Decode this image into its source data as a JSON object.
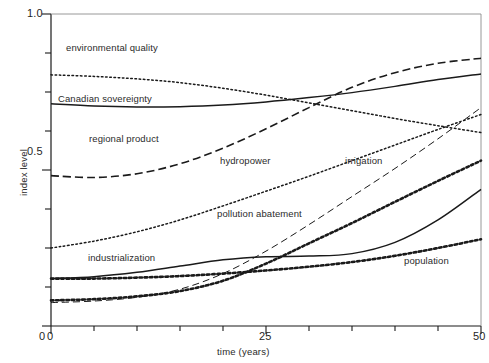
{
  "chart_data": {
    "type": "line",
    "title": "",
    "xlabel": "time (years)",
    "ylabel": "index level",
    "xlim": [
      0,
      50
    ],
    "ylim": [
      0,
      1.0
    ],
    "grid": false,
    "legend_position": "inline-annotations",
    "x_ticks": [
      0,
      5,
      10,
      15,
      20,
      25,
      30,
      35,
      40,
      45,
      50
    ],
    "x_tick_labels": [
      "0",
      "",
      "",
      "",
      "",
      "25",
      "",
      "",
      "",
      "",
      "50"
    ],
    "y_ticks": [
      0,
      0.125,
      0.25,
      0.375,
      0.5,
      0.625,
      0.75,
      0.875,
      1.0
    ],
    "y_tick_labels": [
      "0",
      "",
      "",
      "",
      "0.5",
      "",
      "",
      "",
      "1.0"
    ],
    "x": [
      0,
      5,
      10,
      15,
      20,
      25,
      30,
      35,
      40,
      45,
      50
    ],
    "series": [
      {
        "name": "environmental quality",
        "style": "dotted",
        "values": [
          0.805,
          0.8,
          0.792,
          0.78,
          0.762,
          0.74,
          0.715,
          0.69,
          0.665,
          0.642,
          0.62
        ]
      },
      {
        "name": "Canadian sovereignty",
        "style": "solid",
        "values": [
          0.712,
          0.705,
          0.702,
          0.703,
          0.708,
          0.718,
          0.732,
          0.748,
          0.768,
          0.79,
          0.808
        ]
      },
      {
        "name": "regional product",
        "style": "dashed",
        "values": [
          0.482,
          0.476,
          0.488,
          0.52,
          0.57,
          0.632,
          0.7,
          0.765,
          0.812,
          0.842,
          0.858
        ]
      },
      {
        "name": "hydropower",
        "style": "dotted",
        "values": [
          0.25,
          0.272,
          0.302,
          0.34,
          0.385,
          0.432,
          0.48,
          0.53,
          0.58,
          0.63,
          0.678
        ]
      },
      {
        "name": "irrigation",
        "style": "dashed-fine",
        "values": [
          0.075,
          0.08,
          0.092,
          0.118,
          0.168,
          0.24,
          0.325,
          0.415,
          0.505,
          0.6,
          0.7
        ]
      },
      {
        "name": "pollution abatement",
        "style": "dotted-bold",
        "values": [
          0.082,
          0.086,
          0.095,
          0.112,
          0.145,
          0.2,
          0.265,
          0.33,
          0.398,
          0.465,
          0.53
        ]
      },
      {
        "name": "industrialization",
        "style": "solid",
        "values": [
          0.152,
          0.158,
          0.172,
          0.192,
          0.212,
          0.222,
          0.224,
          0.232,
          0.268,
          0.34,
          0.438
        ]
      },
      {
        "name": "population",
        "style": "dotted-bold",
        "values": [
          0.152,
          0.152,
          0.155,
          0.16,
          0.168,
          0.178,
          0.19,
          0.205,
          0.225,
          0.25,
          0.278
        ]
      }
    ],
    "annotations": [
      {
        "text": "environmental quality",
        "x_px": 66,
        "y_px": 42
      },
      {
        "text": "Canadian sovereignty",
        "x_px": 58,
        "y_px": 93
      },
      {
        "text": "regional product",
        "x_px": 89,
        "y_px": 133
      },
      {
        "text": "hydropower",
        "x_px": 220,
        "y_px": 155
      },
      {
        "text": "irrigation",
        "x_px": 345,
        "y_px": 155
      },
      {
        "text": "pollution abatement",
        "x_px": 217,
        "y_px": 208
      },
      {
        "text": "industrialization",
        "x_px": 88,
        "y_px": 252
      },
      {
        "text": "population",
        "x_px": 404,
        "y_px": 255
      }
    ]
  },
  "axes": {
    "y_top_label": "1.0",
    "y_mid_label": "0.5",
    "y_zero_label": "0",
    "x_zero_label": "0",
    "x_mid_label": "25",
    "x_max_label": "50",
    "x_title": "time (years)",
    "y_title": "index level"
  },
  "colors": {
    "axis": "#1a1a1a",
    "curve": "#1a1a1a",
    "background": "#ffffff",
    "text": "#1f1f1f"
  }
}
